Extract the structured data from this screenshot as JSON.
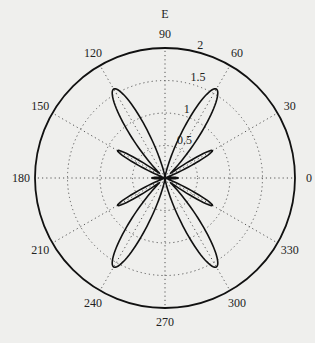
{
  "chart_data": {
    "type": "polar",
    "title": "E",
    "rmax": 2,
    "radial_ticks": [
      0.5,
      1,
      1.5,
      2
    ],
    "radial_tick_labels": [
      "0.5",
      "1",
      "1.5",
      "2"
    ],
    "angle_ticks": [
      0,
      30,
      60,
      90,
      120,
      150,
      180,
      210,
      240,
      270,
      300,
      330
    ],
    "angle_tick_labels": [
      "0",
      "30",
      "60",
      "90",
      "120",
      "150",
      "180",
      "210",
      "240",
      "270",
      "300",
      "330"
    ],
    "grid": "dotted",
    "series": [
      {
        "name": "E",
        "description": "multi-lobe radiation pattern",
        "lobes": [
          {
            "angle_deg": 60,
            "peak": 1.58,
            "width_deg": 12
          },
          {
            "angle_deg": 120,
            "peak": 1.58,
            "width_deg": 12
          },
          {
            "angle_deg": 240,
            "peak": 1.58,
            "width_deg": 12
          },
          {
            "angle_deg": 300,
            "peak": 1.58,
            "width_deg": 12
          },
          {
            "angle_deg": 30,
            "peak": 0.84,
            "width_deg": 6
          },
          {
            "angle_deg": 150,
            "peak": 0.84,
            "width_deg": 6
          },
          {
            "angle_deg": 210,
            "peak": 0.84,
            "width_deg": 6
          },
          {
            "angle_deg": 330,
            "peak": 0.84,
            "width_deg": 6
          },
          {
            "angle_deg": 0,
            "peak": 0.2,
            "width_deg": 8
          },
          {
            "angle_deg": 180,
            "peak": 0.2,
            "width_deg": 8
          }
        ]
      }
    ]
  },
  "colors": {
    "line": "#111111",
    "grid": "#555555",
    "background": "#efefed"
  }
}
